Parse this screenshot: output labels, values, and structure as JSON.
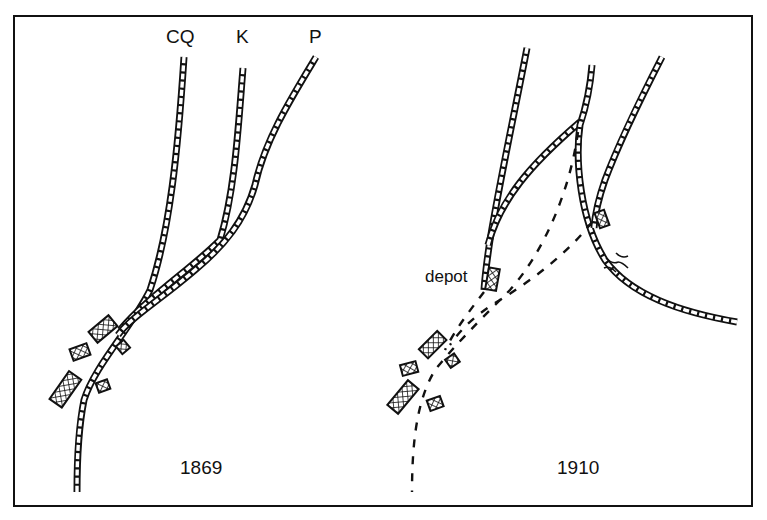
{
  "diagram": {
    "type": "railway-junction-comparison",
    "panels": [
      {
        "year": "1869",
        "line_labels": [
          "CQ",
          "K",
          "P"
        ],
        "features": [
          "main-line-CQ",
          "branch-K",
          "branch-P",
          "station-buildings"
        ]
      },
      {
        "year": "1910",
        "annotations": [
          "depot"
        ],
        "features": [
          "relocated-lines",
          "abandoned-track-dashed",
          "bridge",
          "station-buildings"
        ]
      }
    ]
  },
  "labels": {
    "cq": "CQ",
    "k": "K",
    "p": "P",
    "year_left": "1869",
    "year_right": "1910",
    "depot": "depot"
  },
  "colors": {
    "ink": "#111111",
    "background": "#ffffff"
  }
}
